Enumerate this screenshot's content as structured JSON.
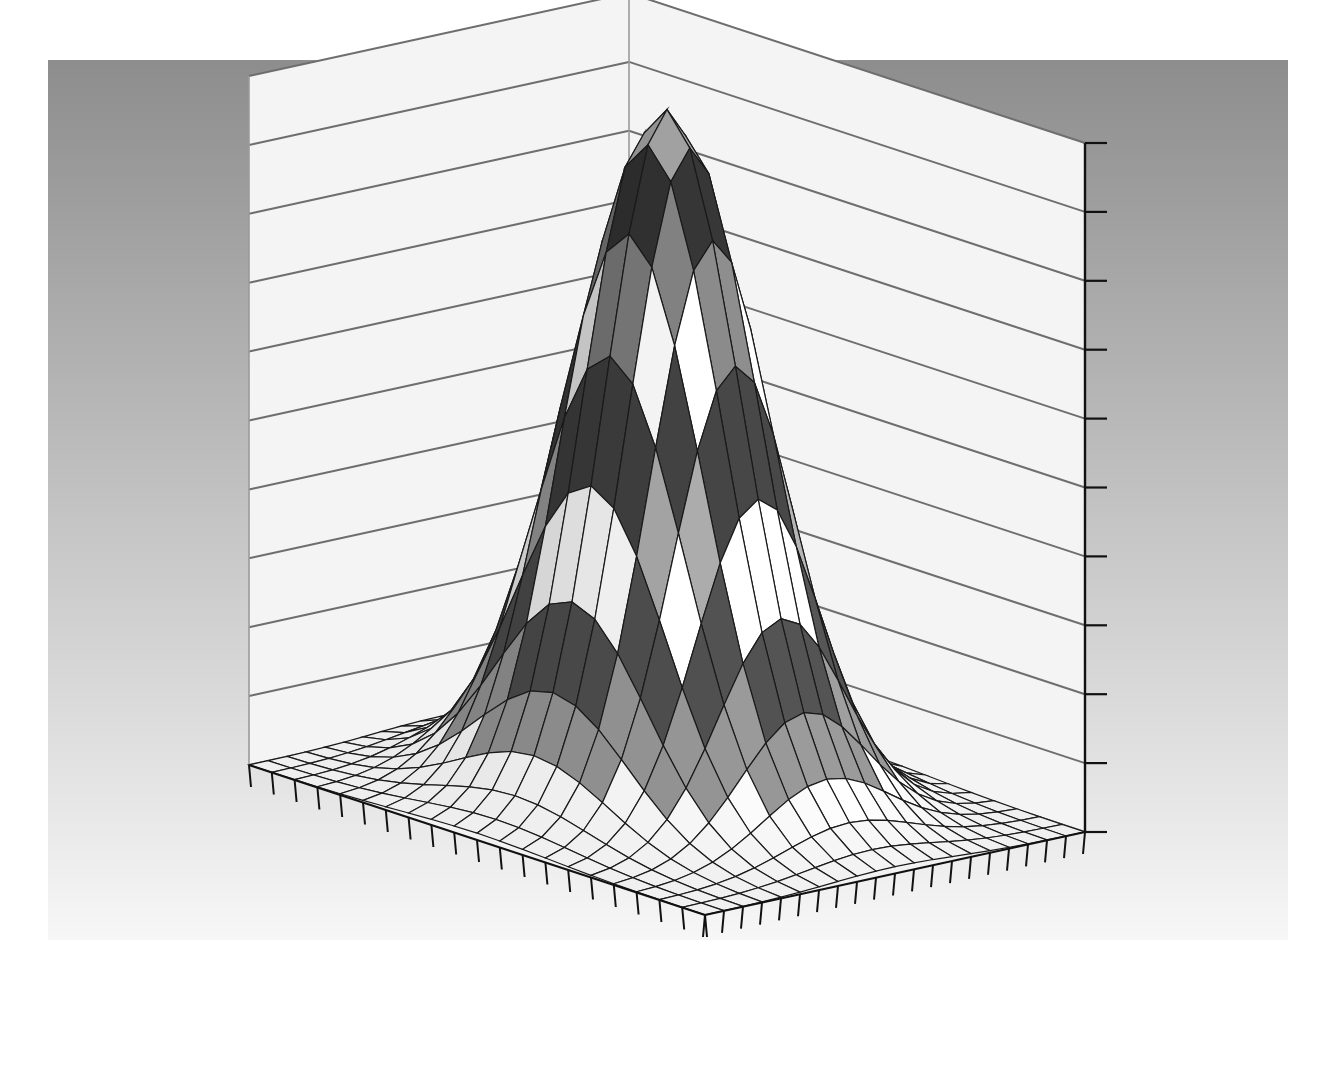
{
  "figure": {
    "width": 1324,
    "height": 1072,
    "background_color": "#ffffff",
    "title": "",
    "type": "3d-surface-plot"
  },
  "plot_box": {
    "left": 48,
    "top": 60,
    "right": 1288,
    "bottom": 940,
    "background_gradient_top": "#8d8d8d",
    "background_gradient_bottom": "#f7f7f7",
    "wall_color": "#f4f4f4",
    "floor_color": "#f2f2f2",
    "gridline_color": "#6e6e6e",
    "axis_line_color": "#5a5a5a",
    "tick_color": "#111111"
  },
  "axes": {
    "back_corner": {
      "x": 810,
      "y": 62
    },
    "left_wall": {
      "name": "left-back-wall",
      "gridline_count": 11,
      "top_left": {
        "x": 247,
        "y": 118
      },
      "tick_count": 0
    },
    "right_wall": {
      "name": "right-back-wall",
      "gridline_count": 11,
      "vertical_axis_x": 1085,
      "vertical_tick_count": 11,
      "tick_labels": []
    },
    "floor_front_left_edge": {
      "name": "x-axis",
      "tick_count": 21,
      "from": {
        "x": 249,
        "y": 765
      },
      "to": {
        "x": 705,
        "y": 915
      },
      "tick_labels": []
    },
    "floor_front_right_edge": {
      "name": "y-axis",
      "tick_count": 21,
      "from": {
        "x": 705,
        "y": 915
      },
      "to": {
        "x": 1085,
        "y": 832
      },
      "tick_labels": []
    },
    "z_axis": {
      "name": "z-axis",
      "from": {
        "x": 1085,
        "y": 832
      },
      "to": {
        "x": 1085,
        "y": 143
      },
      "tick_count": 11,
      "tick_labels": []
    }
  },
  "chart_data": {
    "type": "surface",
    "title": "",
    "xlabel": "",
    "ylabel": "",
    "zlabel": "",
    "grid": true,
    "legend": false,
    "colormap": "grayscale-banded",
    "shading": "faceted",
    "mesh_color": "#1a1a1a",
    "xlim": [
      -3,
      3
    ],
    "ylim": [
      -3,
      3
    ],
    "zlim": [
      0,
      1
    ],
    "nx": 21,
    "ny": 21,
    "contour_band_count": 10,
    "band_colors": [
      "#f0f0f0",
      "#8e8e8e",
      "#4a4a4a",
      "#efefef",
      "#9a9a9a",
      "#3c3c3c",
      "#e8e8e8",
      "#777777",
      "#303030",
      "#9c9c9c"
    ],
    "surface_function": "gaussian-bump",
    "peak": {
      "x": 0.0,
      "y": 0.0,
      "z": 1.0
    },
    "description": "Single smooth central peak rising from a near-flat base; radially symmetric bell shape",
    "x": [
      -3.0,
      -2.7,
      -2.4,
      -2.1,
      -1.8,
      -1.5,
      -1.2,
      -0.9,
      -0.6,
      -0.3,
      0.0,
      0.3,
      0.6,
      0.9,
      1.2,
      1.5,
      1.8,
      2.1,
      2.4,
      2.7,
      3.0
    ],
    "y": [
      -3.0,
      -2.7,
      -2.4,
      -2.1,
      -1.8,
      -1.5,
      -1.2,
      -0.9,
      -0.6,
      -0.3,
      0.0,
      0.3,
      0.6,
      0.9,
      1.2,
      1.5,
      1.8,
      2.1,
      2.4,
      2.7,
      3.0
    ],
    "z_profile_center_row": [
      0.0,
      0.0,
      0.01,
      0.02,
      0.04,
      0.1,
      0.2,
      0.36,
      0.57,
      0.79,
      1.0,
      0.79,
      0.57,
      0.36,
      0.2,
      0.1,
      0.04,
      0.02,
      0.01,
      0.0,
      0.0
    ]
  },
  "view": {
    "azimuth_deg": -37.5,
    "elevation_deg": 30,
    "projection": "orthographic"
  }
}
